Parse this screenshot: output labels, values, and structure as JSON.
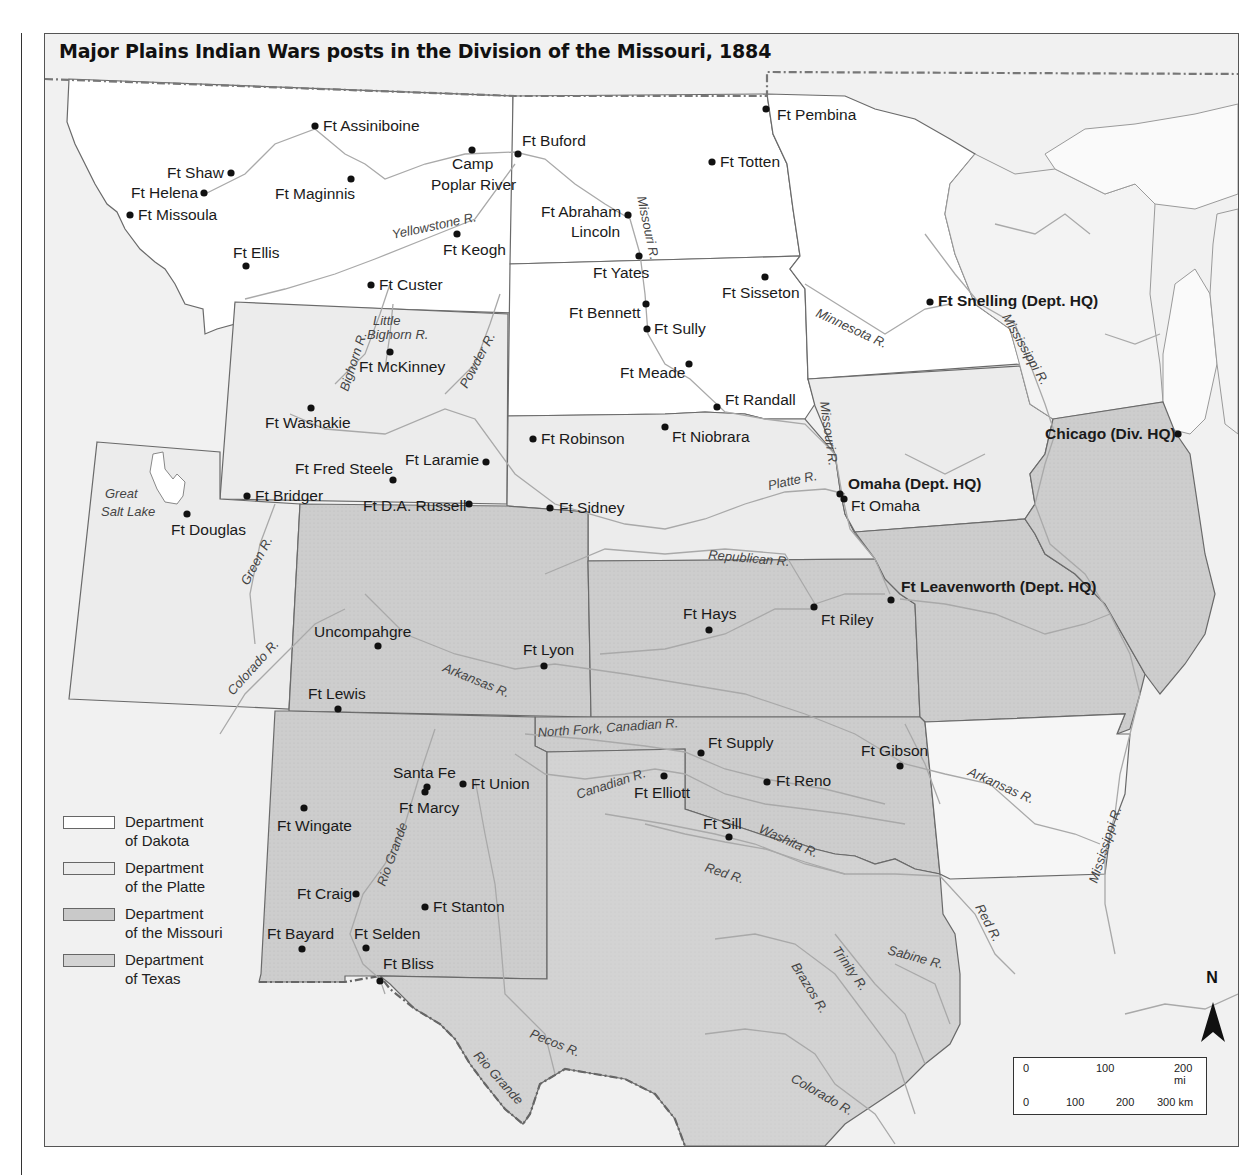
{
  "title": "Major Plains Indian Wars posts in the Division of the Missouri, 1884",
  "colors": {
    "dakota": "#ffffff",
    "platte": "#ececec",
    "missouri": "#d0d0d0",
    "texas": "#d6d6d6",
    "outside": "#f1f1f1",
    "border": "#6a6a6a",
    "river": "#a9a9a9",
    "fort_dot": "#111111"
  },
  "legend": [
    {
      "label": "Department of Dakota",
      "line1": "Department",
      "line2": "of Dakota",
      "color": "#ffffff"
    },
    {
      "label": "Department of the Platte",
      "line1": "Department",
      "line2": "of the Platte",
      "color": "#ececec"
    },
    {
      "label": "Department of the Missouri",
      "line1": "Department",
      "line2": "of the Missouri",
      "color": "#c9c9c9"
    },
    {
      "label": "Department of Texas",
      "line1": "Department",
      "line2": "of Texas",
      "color": "#d3d3d3"
    }
  ],
  "scale_bar": {
    "miles": [
      "0",
      "100",
      "200 mi"
    ],
    "km": [
      "0",
      "100",
      "200",
      "300 km"
    ]
  },
  "north_arrow": "N",
  "forts": [
    {
      "name": "Ft Assiniboine",
      "x": 270,
      "y": 92
    },
    {
      "name": "Ft Shaw",
      "x": 186,
      "y": 139
    },
    {
      "name": "Ft Helena",
      "x": 159,
      "y": 159
    },
    {
      "name": "Ft Missoula",
      "x": 85,
      "y": 181
    },
    {
      "name": "Ft Maginnis",
      "x": 306,
      "y": 145
    },
    {
      "name": "Camp Poplar River",
      "x": 427,
      "y": 116
    },
    {
      "name": "Ft Buford",
      "x": 473,
      "y": 120
    },
    {
      "name": "Ft Keogh",
      "x": 412,
      "y": 200
    },
    {
      "name": "Ft Ellis",
      "x": 201,
      "y": 232
    },
    {
      "name": "Ft Custer",
      "x": 326,
      "y": 251
    },
    {
      "name": "Ft Pembina",
      "x": 721,
      "y": 75
    },
    {
      "name": "Ft Totten",
      "x": 667,
      "y": 128
    },
    {
      "name": "Ft Abraham Lincoln",
      "x": 583,
      "y": 181
    },
    {
      "name": "Ft Yates",
      "x": 594,
      "y": 222
    },
    {
      "name": "Ft Sisseton",
      "x": 720,
      "y": 243
    },
    {
      "name": "Ft Bennett",
      "x": 601,
      "y": 270
    },
    {
      "name": "Ft Sully",
      "x": 602,
      "y": 295
    },
    {
      "name": "Ft Meade",
      "x": 644,
      "y": 330
    },
    {
      "name": "Ft Randall",
      "x": 672,
      "y": 373
    },
    {
      "name": "Ft Snelling (Dept. HQ)",
      "x": 885,
      "y": 268,
      "hq": true
    },
    {
      "name": "Ft McKinney",
      "x": 345,
      "y": 318
    },
    {
      "name": "Ft Washakie",
      "x": 266,
      "y": 374
    },
    {
      "name": "Ft Fred Steele",
      "x": 348,
      "y": 446
    },
    {
      "name": "Ft Laramie",
      "x": 441,
      "y": 428
    },
    {
      "name": "Ft Bridger",
      "x": 202,
      "y": 462
    },
    {
      "name": "Ft D.A. Russell",
      "x": 424,
      "y": 470
    },
    {
      "name": "Ft Douglas",
      "x": 142,
      "y": 480
    },
    {
      "name": "Ft Robinson",
      "x": 488,
      "y": 405
    },
    {
      "name": "Ft Niobrara",
      "x": 620,
      "y": 393
    },
    {
      "name": "Ft Sidney",
      "x": 505,
      "y": 474
    },
    {
      "name": "Omaha (Dept. HQ)",
      "x": 795,
      "y": 460,
      "hq": true
    },
    {
      "name": "Ft Omaha",
      "x": 798,
      "y": 466
    },
    {
      "name": "Chicago (Div. HQ)",
      "x": 1133,
      "y": 400,
      "hq": true
    },
    {
      "name": "Ft Leavenworth (Dept. HQ)",
      "x": 846,
      "y": 566,
      "hq": true
    },
    {
      "name": "Ft Riley",
      "x": 769,
      "y": 573
    },
    {
      "name": "Ft Hays",
      "x": 664,
      "y": 596
    },
    {
      "name": "Uncompahgre",
      "x": 333,
      "y": 612
    },
    {
      "name": "Ft Lyon",
      "x": 499,
      "y": 632
    },
    {
      "name": "Ft Lewis",
      "x": 293,
      "y": 675
    },
    {
      "name": "Ft Supply",
      "x": 656,
      "y": 719
    },
    {
      "name": "Ft Gibson",
      "x": 855,
      "y": 732
    },
    {
      "name": "Ft Reno",
      "x": 722,
      "y": 748
    },
    {
      "name": "Ft Elliott",
      "x": 619,
      "y": 742
    },
    {
      "name": "Ft Sill",
      "x": 684,
      "y": 803
    },
    {
      "name": "Santa Fe",
      "x": 381,
      "y": 753
    },
    {
      "name": "Ft Marcy",
      "x": 380,
      "y": 757
    },
    {
      "name": "Ft Union",
      "x": 418,
      "y": 750
    },
    {
      "name": "Ft Wingate",
      "x": 259,
      "y": 774
    },
    {
      "name": "Ft Craig",
      "x": 311,
      "y": 860
    },
    {
      "name": "Ft Stanton",
      "x": 380,
      "y": 873
    },
    {
      "name": "Ft Bayard",
      "x": 257,
      "y": 915
    },
    {
      "name": "Ft Selden",
      "x": 321,
      "y": 914
    },
    {
      "name": "Ft Bliss",
      "x": 335,
      "y": 947
    }
  ],
  "rivers": [
    "Yellowstone R.",
    "Missouri R.",
    "Little Bighorn R.",
    "Bighorn R.",
    "Powder R.",
    "Minnesota R.",
    "Mississippi R.",
    "Platte R.",
    "Republican R.",
    "Great Salt Lake",
    "Green R.",
    "Colorado R.",
    "Arkansas R.",
    "North Fork, Canadian R.",
    "Canadian R.",
    "Washita R.",
    "Red R.",
    "Rio Grande",
    "Pecos R.",
    "Brazos R.",
    "Trinity R.",
    "Sabine R.",
    "Colorado R."
  ]
}
